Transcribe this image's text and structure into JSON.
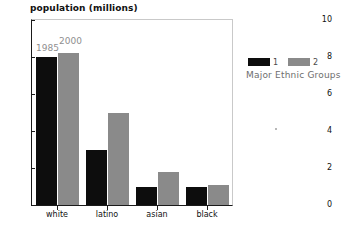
{
  "chart_data": {
    "type": "bar",
    "title": "population (millions)",
    "xlabel": "",
    "ylabel": "",
    "ylim": [
      0,
      10
    ],
    "yticks": [
      0,
      2,
      4,
      6,
      8,
      10
    ],
    "ytick_labels": [
      "0",
      "2",
      "4",
      "6",
      "8",
      "10"
    ],
    "grid": false,
    "legend_position": "right",
    "categories": [
      "white",
      "latino",
      "asian",
      "black"
    ],
    "series": [
      {
        "name": "1",
        "label": "1985",
        "color": "#0d0d0d",
        "values": [
          8.0,
          3.0,
          1.0,
          1.0
        ]
      },
      {
        "name": "2",
        "label": "2000",
        "color": "#8a8a8a",
        "values": [
          8.2,
          5.0,
          1.8,
          1.1
        ]
      }
    ],
    "annotations": [
      {
        "text": "1985",
        "series": "1",
        "category": "white"
      },
      {
        "text": "2000",
        "series": "2",
        "category": "white"
      }
    ]
  },
  "legend": {
    "keys": [
      {
        "label": "1",
        "color": "#0d0d0d"
      },
      {
        "label": "2",
        "color": "#8a8a8a"
      }
    ],
    "caption": "Major Ethnic Groups"
  }
}
